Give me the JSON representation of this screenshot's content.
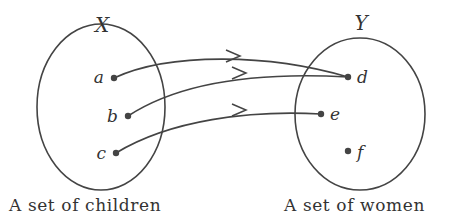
{
  "diagram": {
    "type": "function-mapping",
    "domain_set": {
      "name": "X",
      "caption": "A set of children",
      "elements": [
        "a",
        "b",
        "c"
      ]
    },
    "codomain_set": {
      "name": "Y",
      "caption": "A set of women",
      "elements": [
        "d",
        "e",
        "f"
      ]
    },
    "mappings": [
      {
        "from": "a",
        "to": "d"
      },
      {
        "from": "b",
        "to": "d"
      },
      {
        "from": "c",
        "to": "e"
      }
    ],
    "colors": {
      "stroke": "#444444",
      "text": "#333333",
      "background": "#ffffff"
    }
  }
}
